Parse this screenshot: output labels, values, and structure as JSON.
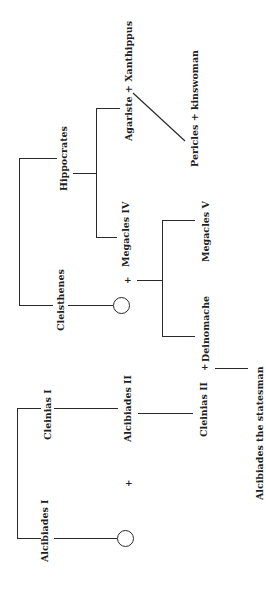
{
  "diagram": {
    "type": "family-tree",
    "orientation": "rotated-90-ccw",
    "people": {
      "hippocrates": "Hippocrates",
      "cleisthenes": "Cleisthenes",
      "agariste": "Agariste",
      "xanthippus": "Xanthippus",
      "megacles_iv": "Megacles IV",
      "pericles": "Pericles",
      "kinswoman": "kinswoman",
      "deinomache": "Deinomache",
      "megacles_v": "Megacles V",
      "cleinias_i": "Cleinias I",
      "alcibiades_i": "Alcibiades I",
      "alcibiades_ii": "Alcibiades II",
      "cleinias_ii": "Cleinias II",
      "alcibiades_statesman": "Alcibiades the statesman"
    },
    "couples": {
      "agariste_xanthippus": "Agariste  +  Xanthippus",
      "pericles_kinswoman": "Pericles  +  kinswoman"
    },
    "symbols": {
      "marriage": "+",
      "unknown_female": "circle"
    },
    "relations": [
      {
        "parent": "Cleisthenes",
        "children": []
      },
      {
        "parent": "Hippocrates",
        "children": [
          "Agariste",
          "Megacles IV"
        ]
      },
      {
        "parents": [
          "Agariste",
          "Xanthippus"
        ],
        "children": [
          "Pericles"
        ]
      },
      {
        "parents": [
          "Cleisthenes' daughter",
          "Megacles IV"
        ],
        "children": [
          "Deinomache",
          "Megacles V"
        ]
      },
      {
        "parents": [
          "Alcibiades I's daughter",
          "Alcibiades II"
        ],
        "children": [
          "Cleinias II"
        ]
      },
      {
        "parents": [
          "Cleinias II",
          "Deinomache"
        ],
        "children": [
          "Alcibiades the statesman"
        ]
      }
    ],
    "colors": {
      "ink": "#1e1e1e",
      "background": "#ffffff"
    }
  }
}
